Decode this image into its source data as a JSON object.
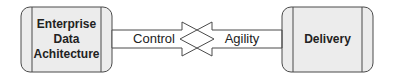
{
  "diagram": {
    "left_box": {
      "lines": [
        "Enterprise",
        "Data",
        "Achitecture"
      ]
    },
    "right_box": {
      "label": "Delivery"
    },
    "arrow_right": {
      "label": "Control"
    },
    "arrow_left": {
      "label": "Agility"
    },
    "colors": {
      "box_fill": "#ececec",
      "stroke": "#4a4a4a",
      "arrow_fill": "#ffffff"
    }
  }
}
